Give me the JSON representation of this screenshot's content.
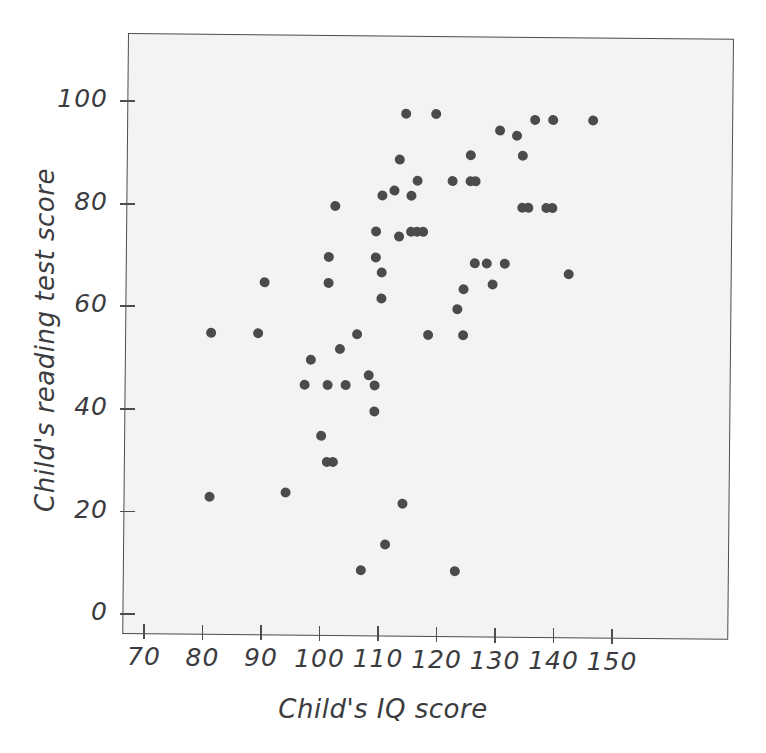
{
  "chart_data": {
    "type": "scatter",
    "title": "",
    "xlabel": "Child's IQ score",
    "ylabel": "Child's reading test score",
    "xlim": [
      66,
      154
    ],
    "ylim": [
      -3,
      112
    ],
    "xticks": [
      70,
      80,
      90,
      100,
      110,
      120,
      130,
      140,
      150
    ],
    "xtick_labels": [
      "70",
      "80",
      "90",
      "100",
      "110",
      "120",
      "130",
      "140",
      "150"
    ],
    "yticks": [
      0,
      20,
      40,
      60,
      80,
      100
    ],
    "ytick_labels": [
      "0",
      "20",
      "40",
      "60",
      "80",
      "100"
    ],
    "grid": false,
    "legend": null,
    "marker": "filled-circle",
    "marker_color": "#4b4b4d",
    "plot_background": "#f3f3f2",
    "frame_color": "#4e4e52",
    "n_points": 62,
    "points": [
      {
        "x": 82,
        "y": 23
      },
      {
        "x": 82,
        "y": 55
      },
      {
        "x": 90,
        "y": 55
      },
      {
        "x": 91,
        "y": 65
      },
      {
        "x": 95,
        "y": 24
      },
      {
        "x": 98,
        "y": 45
      },
      {
        "x": 99,
        "y": 50
      },
      {
        "x": 101,
        "y": 35
      },
      {
        "x": 102,
        "y": 70
      },
      {
        "x": 102,
        "y": 65
      },
      {
        "x": 102,
        "y": 45
      },
      {
        "x": 102,
        "y": 30
      },
      {
        "x": 103,
        "y": 30
      },
      {
        "x": 103,
        "y": 80
      },
      {
        "x": 104,
        "y": 52
      },
      {
        "x": 105,
        "y": 45
      },
      {
        "x": 107,
        "y": 55
      },
      {
        "x": 108,
        "y": 9
      },
      {
        "x": 109,
        "y": 47
      },
      {
        "x": 110,
        "y": 75
      },
      {
        "x": 110,
        "y": 70
      },
      {
        "x": 110,
        "y": 45
      },
      {
        "x": 110,
        "y": 40
      },
      {
        "x": 111,
        "y": 82
      },
      {
        "x": 111,
        "y": 67
      },
      {
        "x": 111,
        "y": 62
      },
      {
        "x": 112,
        "y": 14
      },
      {
        "x": 113,
        "y": 83
      },
      {
        "x": 114,
        "y": 89
      },
      {
        "x": 114,
        "y": 74
      },
      {
        "x": 115,
        "y": 98
      },
      {
        "x": 115,
        "y": 22
      },
      {
        "x": 116,
        "y": 82
      },
      {
        "x": 116,
        "y": 75
      },
      {
        "x": 117,
        "y": 85
      },
      {
        "x": 117,
        "y": 75
      },
      {
        "x": 118,
        "y": 75
      },
      {
        "x": 119,
        "y": 55
      },
      {
        "x": 120,
        "y": 98
      },
      {
        "x": 123,
        "y": 85
      },
      {
        "x": 124,
        "y": 60
      },
      {
        "x": 124,
        "y": 9
      },
      {
        "x": 125,
        "y": 64
      },
      {
        "x": 125,
        "y": 55
      },
      {
        "x": 126,
        "y": 85
      },
      {
        "x": 126,
        "y": 90
      },
      {
        "x": 127,
        "y": 85
      },
      {
        "x": 127,
        "y": 69
      },
      {
        "x": 129,
        "y": 69
      },
      {
        "x": 130,
        "y": 65
      },
      {
        "x": 131,
        "y": 95
      },
      {
        "x": 132,
        "y": 69
      },
      {
        "x": 134,
        "y": 94
      },
      {
        "x": 135,
        "y": 80
      },
      {
        "x": 135,
        "y": 90
      },
      {
        "x": 136,
        "y": 80
      },
      {
        "x": 137,
        "y": 97
      },
      {
        "x": 139,
        "y": 80
      },
      {
        "x": 140,
        "y": 80
      },
      {
        "x": 140,
        "y": 97
      },
      {
        "x": 143,
        "y": 67
      },
      {
        "x": 147,
        "y": 97
      }
    ]
  },
  "axes": {
    "x_title": "Child's IQ score",
    "y_title": "Child's reading test score"
  }
}
